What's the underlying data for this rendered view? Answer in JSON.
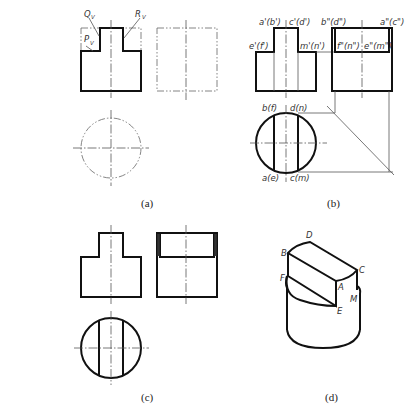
{
  "figure": {
    "panels": [
      {
        "id": "a",
        "caption": "(a)",
        "labels": {
          "Q": "Q",
          "Q_sub": "V",
          "R": "R",
          "R_sub": "V",
          "P": "P",
          "P_sub": "V"
        }
      },
      {
        "id": "b",
        "caption": "(b)",
        "labels": {
          "front_top_left": "a'(b')",
          "front_top_right": "c'(d')",
          "front_mid_left": "e'(f')",
          "front_mid_right": "m'(n')",
          "side_top_left": "b\"(d\")",
          "side_top_right": "a\"(c\")",
          "side_mid_left": "f\"(n\")",
          "side_mid_right": "e\"(m\")",
          "top_upper_left": "b(f)",
          "top_upper_right": "d(n)",
          "top_lower_left": "a(e)",
          "top_lower_right": "c(m)"
        }
      },
      {
        "id": "c",
        "caption": "(c)"
      },
      {
        "id": "d",
        "caption": "(d)",
        "labels": {
          "B": "B",
          "D": "D",
          "C": "C",
          "A": "A",
          "F": "F",
          "E": "E",
          "M": "M"
        }
      }
    ],
    "colors": {
      "line": "#111111",
      "thin_line": "#555555",
      "background": "#ffffff"
    }
  }
}
